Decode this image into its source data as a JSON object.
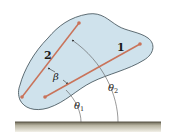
{
  "figure": {
    "colors": {
      "body_fill": "#cfe2ec",
      "body_outline": "#3a4a52",
      "line_color": "#c9735a",
      "dot_color": "#c9735a",
      "ground_top": "#6f6a58",
      "ground_bottom": "#ebe8dc",
      "arc_color": "#555555"
    },
    "labels": {
      "line1": "1",
      "line2": "2",
      "beta": "β",
      "theta1": "θ",
      "theta1_sub": "1",
      "theta2": "θ",
      "theta2_sub": "2"
    }
  }
}
